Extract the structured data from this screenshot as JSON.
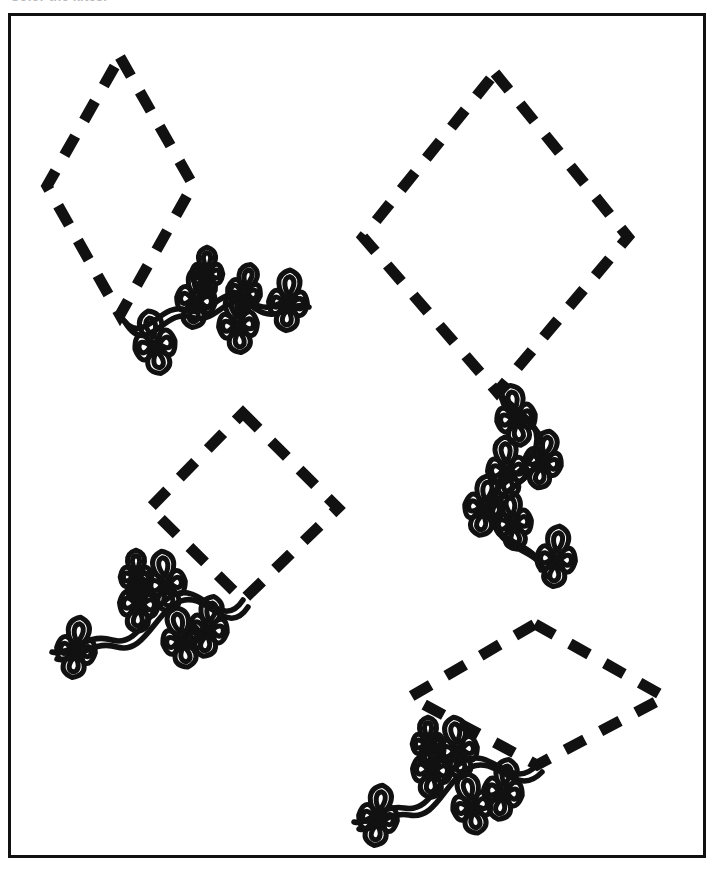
{
  "worksheet": {
    "title": "Color the kites.",
    "page_background": "#ffffff",
    "ink_color": "#111111",
    "frame": {
      "name": "page-border",
      "x": 8,
      "y": 13,
      "width": 698,
      "height": 845,
      "stroke_width": 3
    }
  },
  "artwork": {
    "subject": "kites",
    "style": "black-and-white line art coloring page",
    "count": 4,
    "dash_pattern": "22 18",
    "outline_stroke_width": 11,
    "kites": [
      {
        "id": "kite-1",
        "name": "kite-top-left",
        "shape": "tall-diamond",
        "vertices": {
          "top": [
            120,
            57
          ],
          "left": [
            47,
            186
          ],
          "bottom": [
            120,
            315
          ],
          "right": [
            193,
            185
          ]
        },
        "tail": {
          "name": "kite-tail-top-left",
          "direction": "right-wavy",
          "bow_count": 6,
          "path": "M120,315 C142,352 160,300 186,310 C212,320 222,280 248,300 C274,320 282,292 304,300",
          "bows": [
            {
              "cx": 155,
              "cy": 345,
              "r": 22,
              "rot": -12
            },
            {
              "cx": 196,
              "cy": 300,
              "r": 21,
              "rot": 8
            },
            {
              "cx": 207,
              "cy": 274,
              "r": 17,
              "rot": 0
            },
            {
              "cx": 238,
              "cy": 325,
              "r": 21,
              "rot": -6
            },
            {
              "cx": 244,
              "cy": 292,
              "r": 18,
              "rot": 14
            },
            {
              "cx": 288,
              "cy": 303,
              "r": 21,
              "rot": 4
            }
          ]
        }
      },
      {
        "id": "kite-2",
        "name": "kite-top-right",
        "shape": "wide-diamond",
        "vertices": {
          "top": [
            495,
            73
          ],
          "left": [
            363,
            237
          ],
          "bottom": [
            497,
            392
          ],
          "right": [
            628,
            237
          ]
        },
        "tail": {
          "name": "kite-tail-top-right",
          "direction": "down-zigzag",
          "bow_count": 6,
          "path": "M497,392 C520,414 546,424 534,452 C520,484 478,486 489,516 C500,548 536,540 541,570",
          "bows": [
            {
              "cx": 516,
              "cy": 418,
              "r": 21,
              "rot": -10
            },
            {
              "cx": 543,
              "cy": 462,
              "r": 20,
              "rot": 12
            },
            {
              "cx": 507,
              "cy": 470,
              "r": 21,
              "rot": -4
            },
            {
              "cx": 484,
              "cy": 508,
              "r": 21,
              "rot": 10
            },
            {
              "cx": 513,
              "cy": 523,
              "r": 20,
              "rot": -8
            },
            {
              "cx": 556,
              "cy": 559,
              "r": 21,
              "rot": 6
            }
          ]
        }
      },
      {
        "id": "kite-3",
        "name": "kite-middle-left",
        "shape": "square-diamond",
        "vertices": {
          "top": [
            243,
            413
          ],
          "left": [
            150,
            508
          ],
          "bottom": [
            243,
            600
          ],
          "right": [
            338,
            508
          ]
        },
        "tail": {
          "name": "kite-tail-middle-left",
          "direction": "left-wavy",
          "bow_count": 6,
          "path": "M243,600 C222,632 202,584 176,594 C150,604 140,648 112,640 C86,632 70,656 52,652",
          "bows": [
            {
              "cx": 208,
              "cy": 629,
              "r": 21,
              "rot": 10
            },
            {
              "cx": 166,
              "cy": 584,
              "r": 21,
              "rot": -8
            },
            {
              "cx": 139,
              "cy": 604,
              "r": 21,
              "rot": 4
            },
            {
              "cx": 136,
              "cy": 577,
              "r": 17,
              "rot": 0
            },
            {
              "cx": 182,
              "cy": 640,
              "r": 21,
              "rot": -12
            },
            {
              "cx": 76,
              "cy": 650,
              "r": 21,
              "rot": 8
            }
          ]
        }
      },
      {
        "id": "kite-4",
        "name": "kite-bottom-right",
        "shape": "flat-diamond",
        "vertices": {
          "top": [
            535,
            624
          ],
          "left": [
            410,
            697
          ],
          "bottom": [
            537,
            765
          ],
          "right": [
            665,
            697
          ]
        },
        "tail": {
          "name": "kite-tail-bottom-right",
          "direction": "left-down-wavy",
          "bow_count": 6,
          "path": "M537,765 C512,792 492,748 466,760 C440,772 432,814 404,808 C380,804 368,826 354,822",
          "bows": [
            {
              "cx": 503,
              "cy": 792,
              "r": 21,
              "rot": 10
            },
            {
              "cx": 458,
              "cy": 750,
              "r": 21,
              "rot": -8
            },
            {
              "cx": 432,
              "cy": 770,
              "r": 21,
              "rot": 4
            },
            {
              "cx": 428,
              "cy": 744,
              "r": 17,
              "rot": 0
            },
            {
              "cx": 472,
              "cy": 806,
              "r": 21,
              "rot": -12
            },
            {
              "cx": 378,
              "cy": 818,
              "r": 21,
              "rot": 8
            }
          ]
        }
      }
    ]
  }
}
